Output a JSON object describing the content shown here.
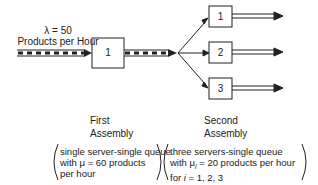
{
  "diagram": {
    "arrival": {
      "rate_line": "λ = 50",
      "unit_line": "Products per Hour"
    },
    "stage1": {
      "server_label": "1",
      "title_line1": "First",
      "title_line2": "Assembly",
      "desc_line1": "single server-single queue",
      "desc_line2": "with μ = 60 products",
      "desc_line3": "per hour"
    },
    "stage2": {
      "servers": [
        "1",
        "2",
        "3"
      ],
      "title_line1": "Second",
      "title_line2": "Assembly",
      "desc_line1": "three servers-single queue",
      "desc_line2": "with μ",
      "desc_line2_sub": "i",
      "desc_line2_rest": " = 20 products per hour",
      "desc_line3_pre": "for ",
      "desc_line3_var": "i",
      "desc_line3_rest": " = 1, 2, 3"
    }
  }
}
